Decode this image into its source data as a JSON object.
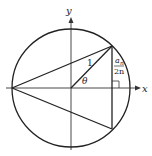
{
  "diagram": {
    "axes": {
      "x_label": "x",
      "y_label": "y"
    },
    "labels": {
      "radius": "1",
      "angle": "θ",
      "half_side_numerator": "a",
      "half_side_subscript": "n",
      "half_side_denominator": "2n"
    },
    "colors": {
      "stroke": "#222222",
      "background": "#ffffff"
    }
  }
}
